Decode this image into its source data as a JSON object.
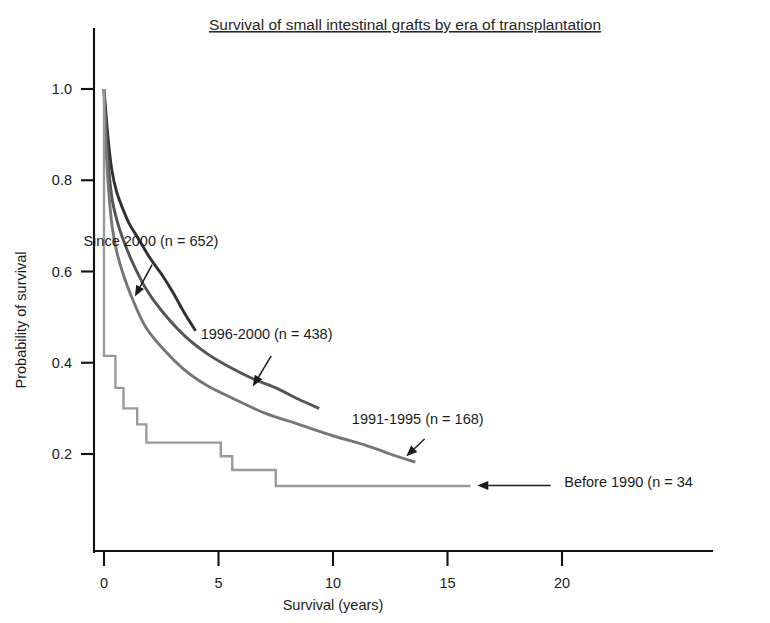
{
  "chart_data": {
    "type": "line",
    "title": "Survival of small intestinal grafts by era of transplantation",
    "xlabel": "Survival (years)",
    "ylabel": "Probability of survival",
    "xlim": [
      -0.6,
      21.5
    ],
    "ylim": [
      0.0,
      1.12
    ],
    "xticks": [
      0,
      5,
      10,
      15,
      20
    ],
    "xtick_labels": [
      "0",
      "5",
      "10",
      "15",
      "20"
    ],
    "yticks": [
      0.2,
      0.4,
      0.6,
      0.8,
      1.0
    ],
    "ytick_labels": [
      "0.2",
      "0.4",
      "0.6",
      "0.8",
      "1.0"
    ],
    "grid": false,
    "legend_position": "inline-annotations",
    "series": [
      {
        "name": "Since 2000 (n = 652)",
        "n": 652,
        "color": "#2f2f2f",
        "style": "smooth",
        "x": [
          0.0,
          0.08,
          0.2,
          0.35,
          0.55,
          0.8,
          1.1,
          1.5,
          2.0,
          2.5,
          3.0,
          3.5,
          4.0
        ],
        "y": [
          1.0,
          0.95,
          0.88,
          0.82,
          0.775,
          0.74,
          0.705,
          0.672,
          0.63,
          0.595,
          0.555,
          0.51,
          0.47
        ]
      },
      {
        "name": "1996-2000 (n = 438)",
        "n": 438,
        "color": "#555555",
        "style": "smooth",
        "x": [
          0.0,
          0.08,
          0.2,
          0.35,
          0.55,
          0.8,
          1.2,
          1.8,
          2.5,
          3.5,
          4.5,
          5.5,
          6.5,
          7.5,
          8.5,
          9.4
        ],
        "y": [
          1.0,
          0.92,
          0.83,
          0.76,
          0.715,
          0.675,
          0.625,
          0.565,
          0.515,
          0.46,
          0.42,
          0.39,
          0.365,
          0.345,
          0.32,
          0.3
        ]
      },
      {
        "name": "1991-1995 (n = 168)",
        "n": 168,
        "color": "#767676",
        "style": "smooth",
        "x": [
          0.0,
          0.08,
          0.2,
          0.35,
          0.55,
          0.8,
          1.2,
          1.8,
          2.5,
          3.5,
          4.5,
          5.5,
          7.0,
          8.5,
          10.0,
          11.5,
          12.5,
          13.6
        ],
        "y": [
          1.0,
          0.88,
          0.78,
          0.7,
          0.645,
          0.6,
          0.545,
          0.48,
          0.435,
          0.385,
          0.35,
          0.325,
          0.29,
          0.265,
          0.24,
          0.218,
          0.2,
          0.182
        ]
      },
      {
        "name": "Before 1990 (n = 34",
        "n": 34,
        "color": "#9a9a9a",
        "style": "step",
        "x": [
          0.0,
          0.0,
          0.5,
          0.5,
          0.85,
          0.85,
          1.45,
          1.45,
          1.85,
          1.85,
          5.1,
          5.1,
          5.6,
          5.6,
          7.5,
          7.5,
          16.0
        ],
        "y": [
          1.0,
          0.415,
          0.415,
          0.345,
          0.345,
          0.3,
          0.3,
          0.265,
          0.265,
          0.225,
          0.225,
          0.195,
          0.195,
          0.165,
          0.165,
          0.13,
          0.13
        ]
      }
    ],
    "annotations": [
      {
        "text": "Since 2000 (n = 652)",
        "text_x": 2.05,
        "text_y": 0.655,
        "arrow_from_x": 2.1,
        "arrow_from_y": 0.615,
        "arrow_to_x": 1.35,
        "arrow_to_y": 0.545
      },
      {
        "text": "1996-2000 (n = 438)",
        "text_x": 7.1,
        "text_y": 0.452,
        "arrow_from_x": 7.3,
        "arrow_from_y": 0.415,
        "arrow_to_x": 6.5,
        "arrow_to_y": 0.348
      },
      {
        "text": "1991-1995 (n = 168)",
        "text_x": 13.7,
        "text_y": 0.265,
        "arrow_from_x": 14.0,
        "arrow_from_y": 0.233,
        "arrow_to_x": 13.2,
        "arrow_to_y": 0.195
      },
      {
        "text": "Before 1990 (n = 34",
        "text_x": 20.1,
        "text_y": 0.127,
        "arrow_from_x": 19.5,
        "arrow_from_y": 0.131,
        "arrow_to_x": 16.3,
        "arrow_to_y": 0.131
      }
    ]
  }
}
